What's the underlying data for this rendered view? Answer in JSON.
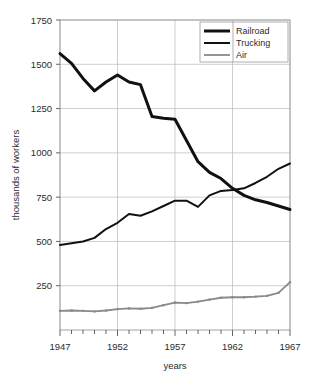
{
  "chart_data": {
    "type": "line",
    "title": "",
    "xlabel": "years",
    "ylabel": "thousands of workers",
    "xlim": [
      1947,
      1967
    ],
    "ylim": [
      0,
      1750
    ],
    "yticks": [
      250,
      500,
      750,
      1000,
      1250,
      1500,
      1750
    ],
    "ytick_labels": [
      "250",
      "500",
      "750",
      "1000",
      "1250",
      "1500",
      "1750"
    ],
    "xticks": [
      1947,
      1952,
      1957,
      1962,
      1967
    ],
    "xtick_labels": [
      "1947",
      "1952",
      "1957",
      "1962",
      "1967"
    ],
    "xminor_step": 1,
    "grid": true,
    "legend_position": "top-right",
    "x": [
      1947,
      1948,
      1949,
      1950,
      1951,
      1952,
      1953,
      1954,
      1955,
      1956,
      1957,
      1958,
      1959,
      1960,
      1961,
      1962,
      1963,
      1964,
      1965,
      1966,
      1967
    ],
    "series": [
      {
        "name": "Railroad",
        "color": "#111111",
        "width": 3.0,
        "markers": false,
        "values": [
          1560,
          1505,
          1420,
          1350,
          1400,
          1440,
          1400,
          1385,
          1205,
          1195,
          1190,
          1070,
          950,
          890,
          855,
          800,
          760,
          735,
          720,
          700,
          680
        ]
      },
      {
        "name": "Trucking",
        "color": "#111111",
        "width": 2.0,
        "markers": false,
        "values": [
          480,
          490,
          500,
          520,
          570,
          605,
          655,
          645,
          670,
          700,
          730,
          730,
          695,
          760,
          785,
          790,
          800,
          830,
          865,
          910,
          940
        ]
      },
      {
        "name": "Air",
        "color": "#8a8a8a",
        "width": 1.8,
        "markers": true,
        "values": [
          108,
          110,
          108,
          105,
          110,
          118,
          122,
          120,
          125,
          140,
          155,
          152,
          160,
          172,
          182,
          185,
          185,
          188,
          193,
          210,
          270
        ]
      }
    ]
  },
  "legend": {
    "entries": [
      {
        "label": "Railroad"
      },
      {
        "label": "Trucking"
      },
      {
        "label": "Air"
      }
    ]
  },
  "axes": {
    "y_title": "thousands of workers",
    "x_title": "years"
  }
}
